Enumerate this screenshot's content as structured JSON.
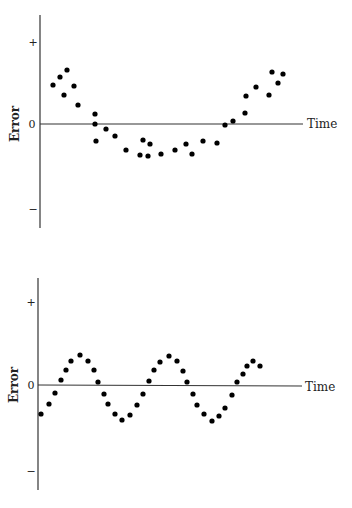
{
  "chart_data": [
    {
      "type": "scatter",
      "title": "",
      "xlabel": "Time",
      "ylabel": "Error",
      "ytick_labels": [
        "+",
        "0",
        "−"
      ],
      "grid": false,
      "legend": null,
      "description": "Errors follow a U-shaped (quadratic) trend over time",
      "x": [
        1,
        2,
        3,
        4,
        5,
        6,
        7,
        8,
        9,
        10,
        11,
        12,
        13,
        14,
        15,
        16,
        17,
        18,
        19,
        20,
        21,
        22,
        23,
        24,
        25,
        26,
        27,
        28,
        29,
        30,
        31
      ],
      "y": [
        0.55,
        0.69,
        0.79,
        0.55,
        0.42,
        0.28,
        0.15,
        0.0,
        -0.08,
        -0.18,
        -0.25,
        -0.38,
        -0.23,
        -0.29,
        -0.45,
        -0.46,
        -0.43,
        -0.38,
        -0.29,
        -0.43,
        -0.25,
        -0.28,
        -0.01,
        0.04,
        0.16,
        0.42,
        0.55,
        0.43,
        0.75,
        0.6,
        0.73
      ]
    },
    {
      "type": "scatter",
      "title": "",
      "xlabel": "Time",
      "ylabel": "Error",
      "ytick_labels": [
        "+",
        "0",
        "−"
      ],
      "grid": false,
      "legend": null,
      "description": "Errors follow a cyclical (sinusoidal) pattern over time",
      "x": [
        1,
        2,
        3,
        4,
        5,
        6,
        7,
        8,
        9,
        10,
        11,
        12,
        13,
        14,
        15,
        16,
        17,
        18,
        19,
        20,
        21,
        22,
        23,
        24,
        25,
        26,
        27,
        28,
        29,
        30,
        31,
        32,
        33,
        34,
        35,
        36
      ],
      "y": [
        -0.34,
        -0.22,
        -0.09,
        0.06,
        0.18,
        0.28,
        0.35,
        0.28,
        0.18,
        0.04,
        -0.11,
        -0.22,
        -0.34,
        -0.41,
        -0.35,
        -0.24,
        -0.11,
        0.05,
        0.18,
        0.27,
        0.34,
        0.28,
        0.16,
        0.04,
        -0.11,
        -0.24,
        -0.34,
        -0.42,
        -0.36,
        -0.27,
        -0.12,
        0.04,
        0.13,
        0.22,
        0.28,
        0.22
      ]
    }
  ],
  "charts": [
    {
      "ylabel": "Error",
      "xlabel": "Time",
      "tick_plus": "+",
      "tick_zero": "0",
      "tick_minus": "−",
      "points": [
        [
          53,
          85
        ],
        [
          60,
          77
        ],
        [
          67,
          70
        ],
        [
          74,
          86
        ],
        [
          64,
          95
        ],
        [
          78,
          105
        ],
        [
          95,
          114
        ],
        [
          95,
          124
        ],
        [
          106,
          129
        ],
        [
          115,
          136
        ],
        [
          96,
          141
        ],
        [
          126,
          150
        ],
        [
          143,
          140
        ],
        [
          150,
          144
        ],
        [
          140,
          155
        ],
        [
          148,
          156
        ],
        [
          161,
          154
        ],
        [
          175,
          150
        ],
        [
          186,
          144
        ],
        [
          192,
          154
        ],
        [
          203,
          141
        ],
        [
          217,
          143
        ],
        [
          225,
          125
        ],
        [
          233,
          121
        ],
        [
          245,
          113
        ],
        [
          246,
          96
        ],
        [
          256,
          87
        ],
        [
          269,
          95
        ],
        [
          272,
          72
        ],
        [
          278,
          83
        ],
        [
          283,
          74
        ]
      ]
    },
    {
      "ylabel": "Error",
      "xlabel": "Time",
      "tick_plus": "+",
      "tick_zero": "0",
      "tick_minus": "−",
      "points": [
        [
          41,
          414
        ],
        [
          49,
          404
        ],
        [
          55,
          393
        ],
        [
          61,
          380
        ],
        [
          66,
          370
        ],
        [
          71,
          361
        ],
        [
          80,
          355
        ],
        [
          88,
          361
        ],
        [
          94,
          370
        ],
        [
          98,
          382
        ],
        [
          104,
          394
        ],
        [
          108,
          404
        ],
        [
          115,
          414
        ],
        [
          122,
          420
        ],
        [
          130,
          415
        ],
        [
          137,
          405
        ],
        [
          143,
          394
        ],
        [
          149,
          381
        ],
        [
          154,
          370
        ],
        [
          160,
          362
        ],
        [
          169,
          356
        ],
        [
          177,
          361
        ],
        [
          183,
          371
        ],
        [
          187,
          382
        ],
        [
          193,
          394
        ],
        [
          197,
          405
        ],
        [
          204,
          414
        ],
        [
          212,
          421
        ],
        [
          219,
          416
        ],
        [
          225,
          408
        ],
        [
          232,
          395
        ],
        [
          237,
          382
        ],
        [
          243,
          374
        ],
        [
          247,
          366
        ],
        [
          253,
          361
        ],
        [
          260,
          366
        ]
      ]
    }
  ]
}
